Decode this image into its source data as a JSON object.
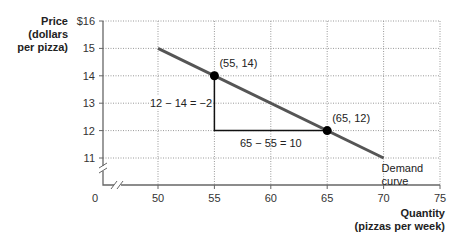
{
  "chart_data": {
    "type": "line",
    "title": "",
    "ylabel": "Price (dollars per pizza)",
    "ylabel_lines": [
      "Price",
      "(dollars",
      "per pizza)"
    ],
    "xlabel": "Quantity (pizzas per week)",
    "xlabel_lines": [
      "Quantity",
      "(pizzas per week)"
    ],
    "xlim": [
      50,
      75
    ],
    "ylim": [
      11,
      16
    ],
    "x_ticks": [
      50,
      55,
      60,
      65,
      70,
      75
    ],
    "y_ticks": [
      11,
      12,
      13,
      14,
      15,
      16
    ],
    "y_tick_labels": [
      "11",
      "12",
      "13",
      "14",
      "15",
      "$16"
    ],
    "origin_label": "0",
    "axis_breaks": true,
    "grid": true,
    "series": [
      {
        "name": "Demand curve",
        "label_lines": [
          "Demand",
          "curve"
        ],
        "x": [
          50,
          70
        ],
        "y": [
          15,
          11
        ],
        "color": "#555555"
      }
    ],
    "points": [
      {
        "x": 55,
        "y": 14,
        "label": "(55, 14)"
      },
      {
        "x": 65,
        "y": 12,
        "label": "(65, 12)"
      }
    ],
    "annotations": [
      {
        "text": "12 − 14 = −2",
        "type": "rise",
        "from": [
          55,
          14
        ],
        "to": [
          55,
          12
        ]
      },
      {
        "text": "65 − 55 = 10",
        "type": "run",
        "from": [
          55,
          12
        ],
        "to": [
          65,
          12
        ]
      }
    ]
  }
}
